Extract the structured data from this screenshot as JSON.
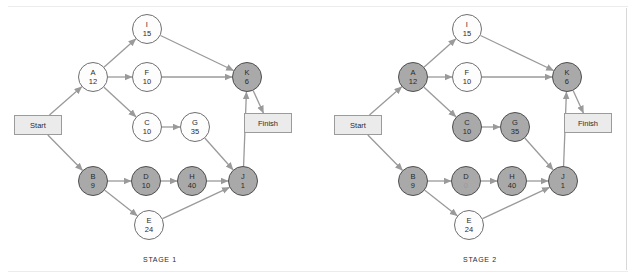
{
  "figure": {
    "background_color": "#ffffff",
    "edge_color": "#9a9a9a",
    "node_plain_fill": "#fdfdfd",
    "node_shaded_fill": "#a9a9a9",
    "node_stroke": "#6f6f6f",
    "terminal_fill": "#ebebeb",
    "terminal_stroke": "#9b9b9b"
  },
  "terminals": {
    "start_label": "Start",
    "finish_label": "Finish"
  },
  "stages": [
    {
      "caption": "STAGE 1",
      "nodes": [
        {
          "id": "I",
          "name": "I",
          "duration": "15",
          "shaded": false,
          "x": 132,
          "y": 14
        },
        {
          "id": "A",
          "name": "A",
          "duration": "12",
          "shaded": false,
          "x": 78,
          "y": 62
        },
        {
          "id": "F",
          "name": "F",
          "duration": "10",
          "shaded": false,
          "x": 132,
          "y": 62
        },
        {
          "id": "K",
          "name": "K",
          "duration": "6",
          "shaded": true,
          "x": 232,
          "y": 62
        },
        {
          "id": "C",
          "name": "C",
          "duration": "10",
          "shaded": false,
          "x": 132,
          "y": 112
        },
        {
          "id": "G",
          "name": "G",
          "duration": "35",
          "shaded": false,
          "x": 180,
          "y": 112
        },
        {
          "id": "B",
          "name": "B",
          "duration": "9",
          "shaded": true,
          "x": 78,
          "y": 166
        },
        {
          "id": "D",
          "name": "D",
          "duration": "10",
          "shaded": true,
          "x": 131,
          "y": 166
        },
        {
          "id": "H",
          "name": "H",
          "duration": "40",
          "shaded": true,
          "x": 177,
          "y": 166
        },
        {
          "id": "J",
          "name": "J",
          "duration": "1",
          "shaded": true,
          "x": 228,
          "y": 166
        },
        {
          "id": "E",
          "name": "E",
          "duration": "24",
          "shaded": false,
          "x": 134,
          "y": 210
        }
      ],
      "start": {
        "x": 14,
        "y": 115,
        "w": 48,
        "h": 20
      },
      "finish": {
        "x": 244,
        "y": 113,
        "w": 48,
        "h": 20
      },
      "edges": [
        {
          "from": "Start",
          "to": "A"
        },
        {
          "from": "Start",
          "to": "B"
        },
        {
          "from": "A",
          "to": "I"
        },
        {
          "from": "A",
          "to": "F"
        },
        {
          "from": "A",
          "to": "C"
        },
        {
          "from": "I",
          "to": "K"
        },
        {
          "from": "F",
          "to": "K"
        },
        {
          "from": "C",
          "to": "G"
        },
        {
          "from": "G",
          "to": "J"
        },
        {
          "from": "B",
          "to": "D"
        },
        {
          "from": "B",
          "to": "E"
        },
        {
          "from": "D",
          "to": "H"
        },
        {
          "from": "H",
          "to": "J"
        },
        {
          "from": "E",
          "to": "J"
        },
        {
          "from": "J",
          "to": "K"
        },
        {
          "from": "K",
          "to": "Finish"
        }
      ]
    },
    {
      "caption": "STAGE 2",
      "nodes": [
        {
          "id": "I",
          "name": "I",
          "duration": "15",
          "shaded": false,
          "x": 132,
          "y": 14
        },
        {
          "id": "A",
          "name": "A",
          "duration": "12",
          "shaded": true,
          "x": 78,
          "y": 62
        },
        {
          "id": "F",
          "name": "F",
          "duration": "10",
          "shaded": false,
          "x": 132,
          "y": 62
        },
        {
          "id": "K",
          "name": "K",
          "duration": "6",
          "shaded": true,
          "x": 232,
          "y": 62
        },
        {
          "id": "C",
          "name": "C",
          "duration": "10",
          "shaded": true,
          "x": 132,
          "y": 112
        },
        {
          "id": "G",
          "name": "G",
          "duration": "35",
          "shaded": true,
          "x": 180,
          "y": 112
        },
        {
          "id": "B",
          "name": "B",
          "duration": "9",
          "shaded": true,
          "x": 78,
          "y": 166
        },
        {
          "id": "D",
          "name": "D",
          "duration": "0",
          "shaded": true,
          "x": 131,
          "y": 166
        },
        {
          "id": "H",
          "name": "H",
          "duration": "40",
          "shaded": true,
          "x": 177,
          "y": 166
        },
        {
          "id": "J",
          "name": "J",
          "duration": "1",
          "shaded": true,
          "x": 228,
          "y": 166
        },
        {
          "id": "E",
          "name": "E",
          "duration": "24",
          "shaded": false,
          "x": 134,
          "y": 210
        }
      ],
      "start": {
        "x": 14,
        "y": 115,
        "w": 48,
        "h": 20
      },
      "finish": {
        "x": 244,
        "y": 113,
        "w": 48,
        "h": 20
      },
      "edges": [
        {
          "from": "Start",
          "to": "A"
        },
        {
          "from": "Start",
          "to": "B"
        },
        {
          "from": "A",
          "to": "I"
        },
        {
          "from": "A",
          "to": "F"
        },
        {
          "from": "A",
          "to": "C"
        },
        {
          "from": "I",
          "to": "K"
        },
        {
          "from": "F",
          "to": "K"
        },
        {
          "from": "C",
          "to": "G"
        },
        {
          "from": "G",
          "to": "J"
        },
        {
          "from": "B",
          "to": "D"
        },
        {
          "from": "B",
          "to": "E"
        },
        {
          "from": "D",
          "to": "H"
        },
        {
          "from": "H",
          "to": "J"
        },
        {
          "from": "E",
          "to": "J"
        },
        {
          "from": "J",
          "to": "K"
        },
        {
          "from": "K",
          "to": "Finish"
        }
      ]
    }
  ]
}
